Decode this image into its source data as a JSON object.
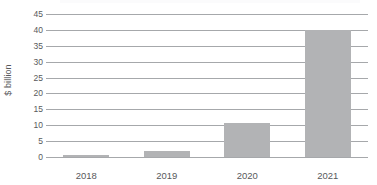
{
  "chart_data": {
    "type": "bar",
    "title": "",
    "subtitle": "",
    "xlabel": "",
    "ylabel": "$ billion",
    "categories": [
      "2018",
      "2019",
      "2020",
      "2021"
    ],
    "values": [
      0.5,
      1.8,
      10.7,
      40.0
    ],
    "series": [
      {
        "name": "$ billion",
        "values": [
          0.5,
          1.8,
          10.7,
          40.0
        ]
      }
    ],
    "ylim": [
      0,
      45
    ],
    "ytick_labels": [
      "0",
      "5",
      "10",
      "15",
      "20",
      "25",
      "30",
      "35",
      "40",
      "45"
    ],
    "ytick_values": [
      0,
      5,
      10,
      15,
      20,
      25,
      30,
      35,
      40,
      45
    ],
    "grid": true,
    "grid_axis": "y",
    "legend": false,
    "legend_position": "none",
    "annotations": [],
    "colors": {
      "bar_fill": "#b2b3b5",
      "gridline": "#a6a8ab",
      "text": "#58595b",
      "background": "#ffffff"
    }
  }
}
